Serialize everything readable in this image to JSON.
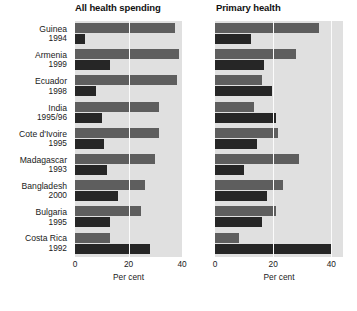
{
  "chart_data": {
    "type": "bar",
    "orientation": "horizontal",
    "title": "",
    "panels": [
      {
        "title": "All health spending",
        "xlabel": "Per cent",
        "xlim": [
          0,
          40
        ],
        "xticks": [
          0,
          20,
          40
        ],
        "xticklabels": [
          "0",
          "20",
          "40"
        ],
        "grid": true,
        "series": [
          {
            "name": "richest",
            "values": [
              37.3,
              39.0,
              38.0,
              31.5,
              31.5,
              30.0,
              26.0,
              24.5,
              13.0
            ]
          },
          {
            "name": "poorest",
            "values": [
              3.7,
              13.0,
              8.0,
              10.0,
              11.0,
              12.0,
              16.0,
              13.0,
              28.0
            ]
          }
        ]
      },
      {
        "title": "Primary health",
        "xlabel": "Per cent",
        "xlim": [
          0,
          44
        ],
        "xticks": [
          0,
          20,
          40
        ],
        "xticklabels": [
          "0",
          "20",
          "40"
        ],
        "grid": true,
        "series": [
          {
            "name": "richest",
            "values": [
              35.7,
              28.0,
              16.0,
              13.5,
              21.5,
              29.0,
              23.5,
              21.0,
              8.4
            ]
          },
          {
            "name": "poorest",
            "values": [
              12.5,
              17.0,
              19.5,
              21.0,
              14.5,
              10.0,
              18.0,
              16.0,
              40.0
            ]
          }
        ]
      }
    ],
    "categories": [
      {
        "country": "Guinea",
        "year": "1994"
      },
      {
        "country": "Armenia",
        "year": "1999"
      },
      {
        "country": "Ecuador",
        "year": "1998"
      },
      {
        "country": "India",
        "year": "1995/96"
      },
      {
        "country": "Cote d'Ivoire",
        "year": "1995"
      },
      {
        "country": "Madagascar",
        "year": "1993"
      },
      {
        "country": "Bangladesh",
        "year": "2000"
      },
      {
        "country": "Bulgaria",
        "year": "1995"
      },
      {
        "country": "Costa Rica",
        "year": "1992"
      }
    ],
    "colors": {
      "panel_background": "#e0e0e0",
      "gridline": "#fbfbfb",
      "bar_richest": "#5e5e5e",
      "bar_poorest": "#262626",
      "page_background": "#ffffff",
      "text": "#1a1a1a"
    }
  }
}
